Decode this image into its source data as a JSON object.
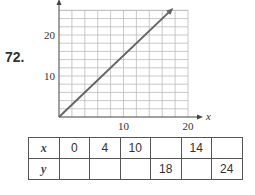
{
  "problem": {
    "number": "72."
  },
  "chart_data": {
    "type": "line",
    "title": "",
    "xlabel": "x",
    "ylabel": "",
    "xlim": [
      0,
      20
    ],
    "ylim": [
      0,
      26
    ],
    "grid": true,
    "x_ticks": [
      10,
      20
    ],
    "y_ticks": [
      10,
      20
    ],
    "x_tick_labels": [
      "10",
      "20"
    ],
    "y_tick_labels": [
      "10",
      "20"
    ],
    "grid_step_x": 2,
    "grid_step_y": 2,
    "series": [
      {
        "name": "y = 1.5x",
        "x": [
          0,
          17.5
        ],
        "y": [
          0,
          26.25
        ],
        "arrow_end": true
      }
    ]
  },
  "table": {
    "row_x": {
      "label": "x",
      "cells": [
        "0",
        "4",
        "10",
        "",
        "14",
        ""
      ]
    },
    "row_y": {
      "label": "y",
      "cells": [
        "",
        "",
        "",
        "18",
        "",
        "24"
      ]
    }
  },
  "colors": {
    "line": "#666666",
    "grid": "#bbbbbb",
    "axis": "#444444"
  }
}
